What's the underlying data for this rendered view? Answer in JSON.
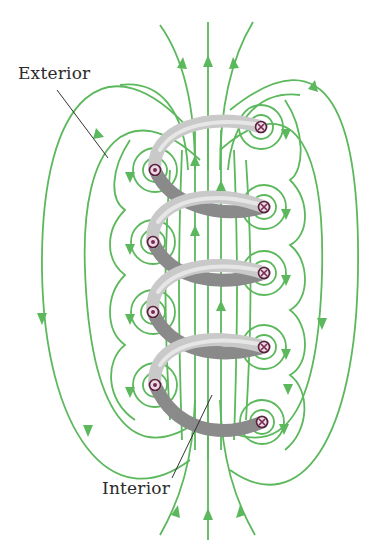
{
  "labels": {
    "exterior": "Exterior",
    "interior": "Interior"
  },
  "colors": {
    "field_line": "#5cb85c",
    "wire_front": "#c9c9c9",
    "wire_back": "#8a8a8a",
    "marker": "#7a2a52",
    "label_text": "#2b2b2b"
  },
  "coil": {
    "turns": 4,
    "left_markers": {
      "symbol": "dot",
      "meaning": "current out of page",
      "positions_y": [
        170,
        242,
        312,
        385
      ]
    },
    "right_markers": {
      "symbol": "cross",
      "meaning": "current into page",
      "positions_y": [
        127,
        207,
        273,
        347,
        422
      ]
    }
  },
  "field": {
    "interior_direction": "up",
    "exterior_direction": "down"
  }
}
